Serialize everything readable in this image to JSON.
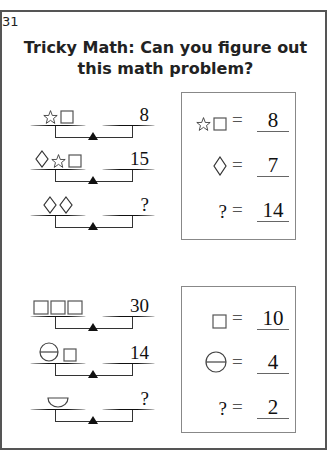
{
  "page": {
    "number": "31",
    "title_line1": "Tricky Math: Can you figure out",
    "title_line2": "this math problem?"
  },
  "puzzle1": {
    "scales": [
      {
        "left": [
          "star",
          "square"
        ],
        "right": "8"
      },
      {
        "left": [
          "diamond",
          "star",
          "square"
        ],
        "right": "15"
      },
      {
        "left": [
          "diamond",
          "diamond"
        ],
        "right": "?"
      }
    ],
    "answers": [
      {
        "symbols": [
          "star",
          "square"
        ],
        "equals": "=",
        "value": "8"
      },
      {
        "symbols": [
          "diamond"
        ],
        "equals": "=",
        "value": "7"
      },
      {
        "symbols": [
          "?"
        ],
        "equals": "=",
        "value": "14"
      }
    ]
  },
  "puzzle2": {
    "scales": [
      {
        "left": [
          "square",
          "square",
          "square"
        ],
        "right": "30"
      },
      {
        "left": [
          "circle-line",
          "square"
        ],
        "right": "14"
      },
      {
        "left": [
          "half-circle"
        ],
        "right": "?"
      }
    ],
    "answers": [
      {
        "symbols": [
          "square"
        ],
        "equals": "=",
        "value": "10"
      },
      {
        "symbols": [
          "circle-line"
        ],
        "equals": "=",
        "value": "4"
      },
      {
        "symbols": [
          "?"
        ],
        "equals": "=",
        "value": "2"
      }
    ]
  },
  "colors": {
    "ink": "#111111",
    "frame": "#555555",
    "box_border": "#888888"
  }
}
